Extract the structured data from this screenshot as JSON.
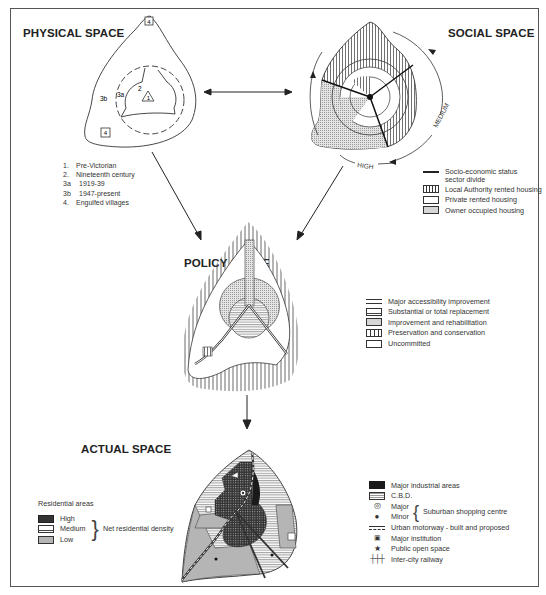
{
  "panels": {
    "physical": {
      "title": "PHYSICAL SPACE",
      "zone_labels": {
        "z1": "1",
        "z2": "2",
        "z3a": "3a",
        "z3b": "3b",
        "v1": "4",
        "v2": "4"
      },
      "legend": [
        {
          "key": "1.",
          "label": "Pre-Victorian"
        },
        {
          "key": "2.",
          "label": "Nineteenth century"
        },
        {
          "key": "3a",
          "label": "1919-39"
        },
        {
          "key": "3b",
          "label": "1947-present"
        },
        {
          "key": "4.",
          "label": "Engulfed villages"
        }
      ]
    },
    "social": {
      "title": "SOCIAL SPACE",
      "arc_labels": {
        "medium": "MEDIUM",
        "high": "HIGH"
      },
      "legend": [
        {
          "symbol": "line",
          "label": "Socio-economic status",
          "label2": "sector divide"
        },
        {
          "symbol": "vertical-hatch",
          "label": "Local Authority rented housing"
        },
        {
          "symbol": "blank",
          "label": "Private rented housing"
        },
        {
          "symbol": "stipple",
          "label": "Owner occupied housing"
        }
      ]
    },
    "policy": {
      "title": "POLICY SPACE",
      "legend": [
        {
          "symbol": "road",
          "label": "Major accessibility  improvement"
        },
        {
          "symbol": "horizontal-hatch",
          "label": "Substantial or total  replacement"
        },
        {
          "symbol": "stipple",
          "label": "Improvement and  rehabilitation"
        },
        {
          "symbol": "vertical-hatch",
          "label": "Preservation and  conservation"
        },
        {
          "symbol": "blank",
          "label": "Uncommitted"
        }
      ]
    },
    "actual": {
      "title": "ACTUAL SPACE",
      "residential_legend": {
        "heading": "Residential areas",
        "items": [
          {
            "symbol": "dark-grid",
            "label": "High"
          },
          {
            "symbol": "horizontal-hatch",
            "label": "Medium"
          },
          {
            "symbol": "grey",
            "label": "Low"
          }
        ],
        "brace_label": "Net residential density"
      },
      "legend": [
        {
          "symbol": "black",
          "label": "Major industrial areas"
        },
        {
          "symbol": "cbd",
          "label": "C.B.D."
        },
        {
          "symbol": "ring",
          "label": "Major"
        },
        {
          "symbol": "dot",
          "label": "Minor"
        },
        {
          "symbol": "motorway",
          "label": "Urban motorway - built and proposed"
        },
        {
          "symbol": "institution",
          "label": "Major institution"
        },
        {
          "symbol": "star",
          "label": "Public open space"
        },
        {
          "symbol": "railway",
          "label": "Inter-city railway"
        }
      ],
      "shopping_brace_label": "Suburban shopping centre"
    }
  },
  "colors": {
    "ink": "#222222",
    "border": "#555555",
    "grey_fill": "#b5b5b5",
    "stipple": "#d6d6d6",
    "black": "#1a1a1a"
  }
}
